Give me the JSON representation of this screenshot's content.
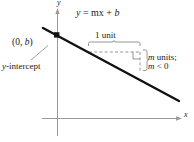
{
  "figure": {
    "type": "coordinate-plane-line-graph",
    "equation": "y = mx + b",
    "axes": {
      "y_label": "y",
      "x_label": "x",
      "y_axis_x_px": 57,
      "x_axis_y_px": 118,
      "origin": [
        57,
        118
      ]
    },
    "line": {
      "label": "y = mx + b",
      "slope_sign": "negative",
      "start_px": [
        43,
        28
      ],
      "end_px": [
        179,
        101
      ],
      "color": "#111111",
      "width_px": 2.4
    },
    "intercept_point": {
      "label": "(0, b)",
      "sublabel": "y-intercept",
      "position_px": [
        57,
        35
      ],
      "marker": "filled-square-dot"
    },
    "slope_triangle": {
      "run_label": "1 unit",
      "rise_label_line1": "m units;",
      "rise_label_line2": "m < 0",
      "run_from_px": [
        89,
        52
      ],
      "run_to_px": [
        140,
        52
      ],
      "rise_from_px": [
        140,
        52
      ],
      "rise_to_px": [
        140,
        71
      ],
      "dash_color": "#8a8a8a",
      "brace_color": "#8a8a8a"
    },
    "leader_line": {
      "name": "y-intercept-leader",
      "from_px": [
        30,
        60
      ],
      "to_px": [
        47,
        46
      ],
      "color": "#9a9a9a"
    },
    "colors": {
      "axis": "#9b9b9b",
      "line": "#111111",
      "text": "#1a1a1a",
      "dash": "#8a8a8a",
      "background": "#ffffff"
    }
  }
}
